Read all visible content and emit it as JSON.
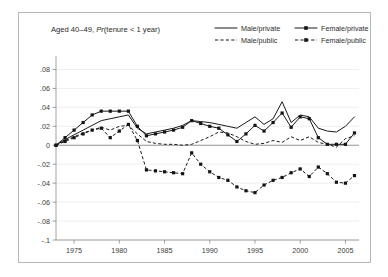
{
  "figure": {
    "title": "Aged 40–49, Pr(tenure < 1 year)",
    "title_plain": "Aged 40–49, ",
    "title_italic": "Pr",
    "title_rest": "(tenure < 1 year)",
    "background_color": "#ffffff",
    "frame_color": "#b9b9b9",
    "line_color": "#1a1a1a",
    "grid_color": "#e8e8ee"
  },
  "legend": {
    "position": "top-right",
    "entries": [
      {
        "label": "Male/private",
        "style": "solid",
        "marker": "none",
        "icon": "legend-line-solid-icon"
      },
      {
        "label": "Female/private",
        "style": "solid",
        "marker": "square",
        "icon": "legend-line-solid-marker-icon"
      },
      {
        "label": "Male/public",
        "style": "dashed",
        "marker": "none",
        "icon": "legend-line-dashed-icon"
      },
      {
        "label": "Female/public",
        "style": "dashed",
        "marker": "square",
        "icon": "legend-line-dashed-marker-icon"
      }
    ]
  },
  "chart_data": {
    "type": "line",
    "title": "Aged 40–49, Pr(tenure < 1 year)",
    "xlabel": "",
    "ylabel": "",
    "xlim": [
      1973,
      2006.5
    ],
    "ylim": [
      -0.1,
      0.09
    ],
    "grid": true,
    "legend_position": "top-right",
    "yticks": [
      0.08,
      0.06,
      0.04,
      0.02,
      0,
      -0.02,
      -0.04,
      -0.06,
      -0.08,
      -0.1
    ],
    "ytick_labels": [
      ".08",
      ".06",
      ".04",
      ".02",
      "0",
      "-.02",
      "-.04",
      "-.06",
      "-.08",
      "-.1"
    ],
    "xticks": [
      1975,
      1980,
      1985,
      1990,
      1995,
      2000,
      2005
    ],
    "xtick_labels": [
      "1975",
      "1980",
      "1985",
      "1990",
      "1995",
      "2000",
      "2005"
    ],
    "x": [
      1973,
      1974,
      1975,
      1976,
      1977,
      1978,
      1979,
      1980,
      1981,
      1982,
      1983,
      1984,
      1985,
      1986,
      1987,
      1988,
      1989,
      1990,
      1991,
      1992,
      1993,
      1994,
      1995,
      1996,
      1997,
      1998,
      1999,
      2000,
      2001,
      2002,
      2003,
      2004,
      2005,
      2006
    ],
    "series": [
      {
        "name": "Male/private",
        "style": "solid",
        "marker": "none",
        "values": [
          0.0,
          0.006,
          0.011,
          0.016,
          0.021,
          0.026,
          0.028,
          0.03,
          0.032,
          0.018,
          0.012,
          0.014,
          0.016,
          0.018,
          0.021,
          0.026,
          0.025,
          0.024,
          0.022,
          0.02,
          0.018,
          0.024,
          0.03,
          0.022,
          0.028,
          0.046,
          0.024,
          0.032,
          0.03,
          0.018,
          0.015,
          0.014,
          0.02,
          0.03
        ]
      },
      {
        "name": "Female/private",
        "style": "solid",
        "marker": "square",
        "values": [
          0.0,
          0.008,
          0.016,
          0.024,
          0.032,
          0.036,
          0.036,
          0.036,
          0.036,
          0.02,
          0.01,
          0.012,
          0.014,
          0.016,
          0.019,
          0.026,
          0.023,
          0.02,
          0.018,
          0.011,
          0.004,
          0.012,
          0.021,
          0.015,
          0.024,
          0.034,
          0.019,
          0.03,
          0.028,
          0.008,
          0.001,
          0.001,
          0.001,
          0.013
        ]
      },
      {
        "name": "Male/public",
        "style": "dashed",
        "marker": "none",
        "values": [
          0.0,
          0.005,
          0.009,
          0.013,
          0.016,
          0.019,
          0.016,
          0.02,
          0.021,
          0.012,
          0.004,
          0.002,
          0.001,
          0.001,
          0.0,
          0.001,
          0.005,
          0.009,
          0.014,
          0.013,
          0.009,
          0.004,
          0.001,
          0.002,
          0.005,
          0.003,
          0.009,
          0.005,
          0.009,
          0.003,
          0.001,
          -0.002,
          0.007,
          0.01
        ]
      },
      {
        "name": "Female/public",
        "style": "dashed",
        "marker": "square",
        "values": [
          0.0,
          0.004,
          0.008,
          0.012,
          0.016,
          0.018,
          0.008,
          0.015,
          0.022,
          0.005,
          -0.026,
          -0.027,
          -0.028,
          -0.029,
          -0.03,
          -0.008,
          -0.02,
          -0.028,
          -0.034,
          -0.037,
          -0.044,
          -0.048,
          -0.05,
          -0.042,
          -0.037,
          -0.034,
          -0.029,
          -0.025,
          -0.033,
          -0.023,
          -0.03,
          -0.039,
          -0.04,
          -0.032
        ]
      }
    ]
  }
}
